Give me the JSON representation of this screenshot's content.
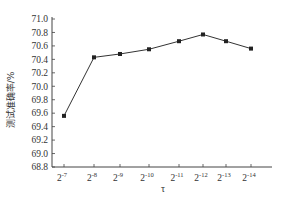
{
  "chart_data": {
    "type": "line",
    "title": "",
    "xlabel": "τ",
    "ylabel": "测试准确率/%",
    "categories": [
      "2^-7",
      "2^-8",
      "2^-9",
      "2^-10",
      "2^-11",
      "2^-12",
      "2^-13",
      "2^-14"
    ],
    "category_labels": [
      {
        "base": "2",
        "exp": "-7"
      },
      {
        "base": "2",
        "exp": "-8"
      },
      {
        "base": "2",
        "exp": "-9"
      },
      {
        "base": "2",
        "exp": "-10"
      },
      {
        "base": "2",
        "exp": "-11"
      },
      {
        "base": "2",
        "exp": "-12"
      },
      {
        "base": "2",
        "exp": "-13"
      },
      {
        "base": "2",
        "exp": "-14"
      }
    ],
    "series": [
      {
        "name": "测试准确率",
        "values": [
          69.56,
          70.43,
          70.48,
          70.55,
          70.67,
          70.77,
          70.67,
          70.56
        ],
        "marker": "square",
        "color": "#222222"
      }
    ],
    "ylim": [
      68.8,
      71.0
    ],
    "yticks": [
      "71.0",
      "70.8",
      "70.6",
      "70.4",
      "70.2",
      "70.0",
      "69.8",
      "69.6",
      "69.4",
      "69.2",
      "69.0",
      "68.8"
    ],
    "grid": false,
    "legend": null
  }
}
